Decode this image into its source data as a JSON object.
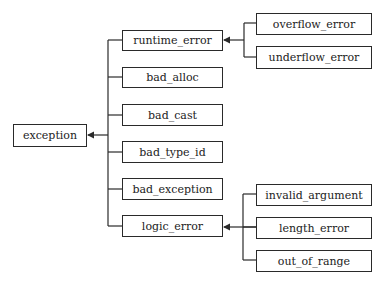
{
  "diagram": {
    "type": "class-hierarchy",
    "root": {
      "label": "exception"
    },
    "level1": [
      {
        "label": "runtime_error"
      },
      {
        "label": "bad_alloc"
      },
      {
        "label": "bad_cast"
      },
      {
        "label": "bad_type_id"
      },
      {
        "label": "bad_exception"
      },
      {
        "label": "logic_error"
      }
    ],
    "runtime_error_children": [
      {
        "label": "overflow_error"
      },
      {
        "label": "underflow_error"
      }
    ],
    "logic_error_children": [
      {
        "label": "invalid_argument"
      },
      {
        "label": "length_error"
      },
      {
        "label": "out_of_range"
      }
    ],
    "colors": {
      "line": "#2a2a2a",
      "box_fill": "#ffffff",
      "text": "#222222"
    }
  }
}
